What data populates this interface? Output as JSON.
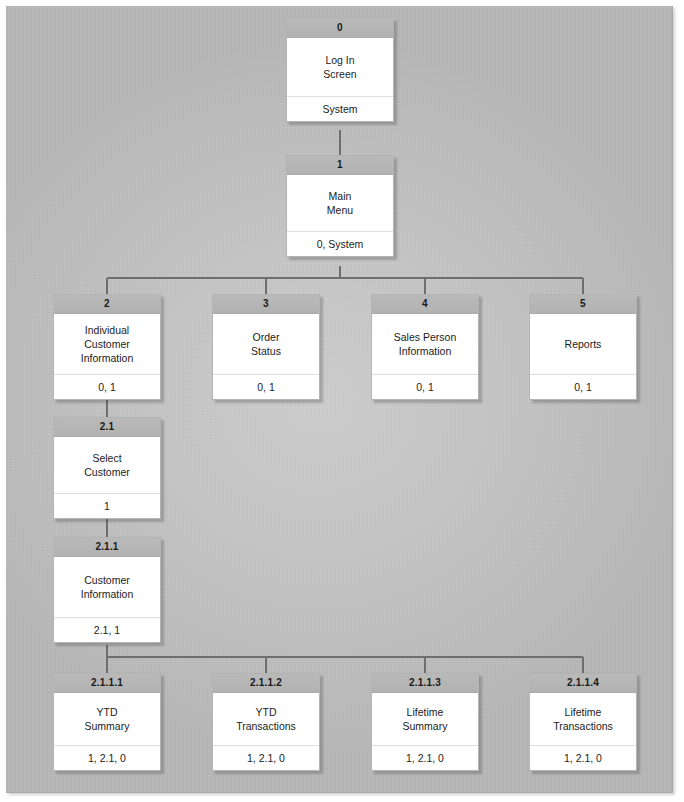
{
  "diagram": {
    "colors": {
      "canvas_background": "#c6c6c6",
      "node_header": "#b5b5b5",
      "node_body": "#ffffff",
      "node_border": "#b4b4b4",
      "connector": "#6e6e6e",
      "text": "#1c1c1c"
    },
    "connector_label": "hierarchy-connector"
  },
  "nodes": [
    {
      "id": "0",
      "title": "Log In\nScreen",
      "title_lines": [
        "Log In",
        "Screen"
      ],
      "footer": "System",
      "level": 0,
      "x": 286,
      "y": 18,
      "class": "lvl0"
    },
    {
      "id": "1",
      "title_lines": [
        "Main",
        "Menu"
      ],
      "footer": "0, System",
      "level": 1,
      "x": 286,
      "y": 155,
      "class": "lvl1"
    },
    {
      "id": "2",
      "title_lines": [
        "Individual",
        "Customer",
        "Information"
      ],
      "footer": "0, 1",
      "level": 2,
      "x": 53,
      "y": 294,
      "class": "lvl2"
    },
    {
      "id": "3",
      "title_lines": [
        "Order",
        "Status"
      ],
      "footer": "0, 1",
      "level": 2,
      "x": 212,
      "y": 294,
      "class": "lvl2"
    },
    {
      "id": "4",
      "title_lines": [
        "Sales Person",
        "Information"
      ],
      "footer": "0, 1",
      "level": 2,
      "x": 371,
      "y": 294,
      "class": "lvl2"
    },
    {
      "id": "5",
      "title_lines": [
        "Reports"
      ],
      "footer": "0, 1",
      "level": 2,
      "x": 529,
      "y": 294,
      "class": "lvl2"
    },
    {
      "id": "2.1",
      "title_lines": [
        "Select",
        "Customer"
      ],
      "footer": "1",
      "level": 3,
      "x": 53,
      "y": 417,
      "class": "lvl2a"
    },
    {
      "id": "2.1.1",
      "title_lines": [
        "Customer",
        "Information"
      ],
      "footer": "2.1, 1",
      "level": 4,
      "x": 53,
      "y": 537,
      "class": "lvl3"
    },
    {
      "id": "2.1.1.1",
      "title_lines": [
        "YTD",
        "Summary"
      ],
      "footer": "1, 2.1, 0",
      "level": 5,
      "x": 53,
      "y": 673,
      "class": "lvl4"
    },
    {
      "id": "2.1.1.2",
      "title_lines": [
        "YTD",
        "Transactions"
      ],
      "footer": "1, 2.1, 0",
      "level": 5,
      "x": 212,
      "y": 673,
      "class": "lvl4"
    },
    {
      "id": "2.1.1.3",
      "title_lines": [
        "Lifetime",
        "Summary"
      ],
      "footer": "1, 2.1, 0",
      "level": 5,
      "x": 371,
      "y": 673,
      "class": "lvl4"
    },
    {
      "id": "2.1.1.4",
      "title_lines": [
        "Lifetime",
        "Transactions"
      ],
      "footer": "1, 2.1, 0",
      "level": 5,
      "x": 529,
      "y": 673,
      "class": "lvl4"
    }
  ],
  "connectors": [
    {
      "name": "link-0-to-1",
      "path": "M340,130 L340,155"
    },
    {
      "name": "link-1-bus-drop",
      "path": "M340,266 L340,278"
    },
    {
      "name": "link-1-bus",
      "path": "M107,278 L583,278"
    },
    {
      "name": "link-bus-to-2",
      "path": "M107,278 L107,294"
    },
    {
      "name": "link-bus-to-3",
      "path": "M266,278 L266,294"
    },
    {
      "name": "link-bus-to-4",
      "path": "M425,278 L425,294"
    },
    {
      "name": "link-bus-to-5",
      "path": "M583,278 L583,294"
    },
    {
      "name": "link-2-to-2.1",
      "path": "M107,397 L107,417"
    },
    {
      "name": "link-2.1-to-2.1.1",
      "path": "M107,517 L107,537"
    },
    {
      "name": "link-2.1.1-bus-drop",
      "path": "M107,645 L107,657"
    },
    {
      "name": "link-2.1.1-bus",
      "path": "M107,657 L583,657"
    },
    {
      "name": "link-bus-to-2.1.1.1",
      "path": "M107,657 L107,673"
    },
    {
      "name": "link-bus-to-2.1.1.2",
      "path": "M266,657 L266,673"
    },
    {
      "name": "link-bus-to-2.1.1.3",
      "path": "M425,657 L425,673"
    },
    {
      "name": "link-bus-to-2.1.1.4",
      "path": "M583,657 L583,673"
    }
  ]
}
